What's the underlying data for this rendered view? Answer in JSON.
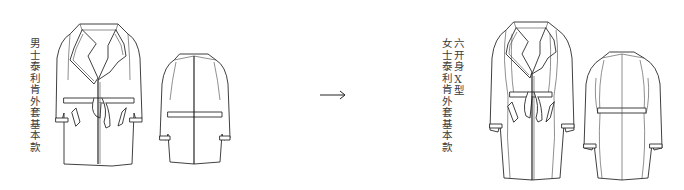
{
  "figure": {
    "left_label": "男士泰利肯外套基本款",
    "right_label_line1": "六开身X型",
    "right_label_line2": "女士泰利肯外套基本款",
    "arrow_glyph": "arrow-right",
    "panels": [
      {
        "name": "men-trench-front",
        "view": "front"
      },
      {
        "name": "men-trench-back",
        "view": "back"
      },
      {
        "name": "women-trench-front",
        "view": "front"
      },
      {
        "name": "women-trench-back",
        "view": "back"
      }
    ],
    "line_color": "#2a2a2a",
    "background": "#ffffff"
  }
}
